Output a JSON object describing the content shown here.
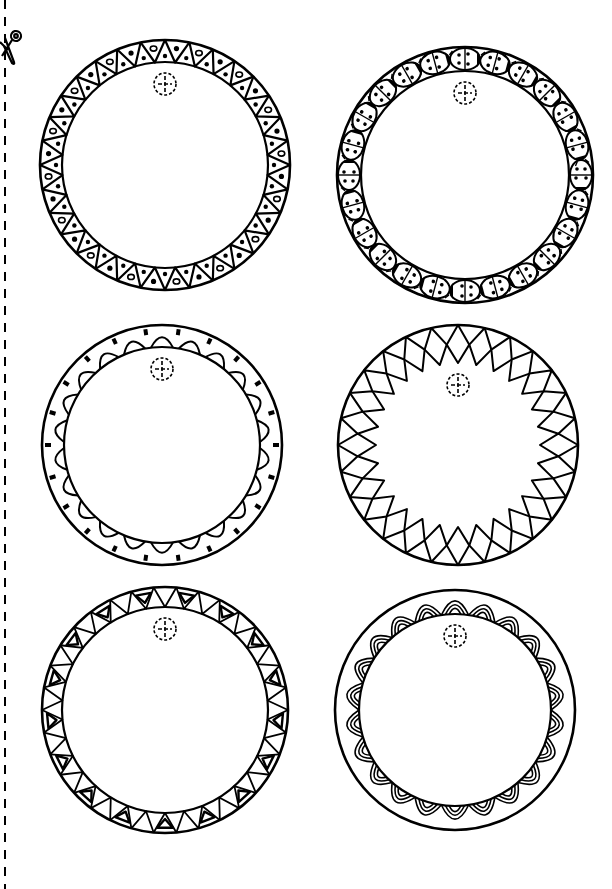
{
  "sheet": {
    "title": "Printable round gift tags",
    "ink_color": "#000000",
    "paper_color": "#ffffff",
    "cut_line": {
      "style": "dashed",
      "icon": "scissors-icon"
    }
  },
  "tags": [
    {
      "id": 1,
      "pattern": "triangles-with-dots",
      "border_label": "Triangle border with dots and rings",
      "segments": 32,
      "cx": 165,
      "cy": 165,
      "r": 125,
      "ring": 22
    },
    {
      "id": 2,
      "pattern": "ladybugs",
      "border_label": "Ladybug border",
      "segments": 24,
      "cx": 465,
      "cy": 175,
      "r": 128,
      "ring": 24
    },
    {
      "id": 3,
      "pattern": "scallops",
      "border_label": "Scalloped border",
      "segments": 22,
      "cx": 162,
      "cy": 445,
      "r": 120,
      "ring": 22
    },
    {
      "id": 4,
      "pattern": "zigzag-squares",
      "border_label": "Zigzag square border",
      "segments": 28,
      "cx": 458,
      "cy": 445,
      "r": 120,
      "ring": 38
    },
    {
      "id": 5,
      "pattern": "nested-triangles",
      "border_label": "Nested triangle border",
      "segments": 34,
      "cx": 165,
      "cy": 710,
      "r": 123,
      "ring": 20
    },
    {
      "id": 6,
      "pattern": "double-arches",
      "border_label": "Double arch border",
      "segments": 22,
      "cx": 455,
      "cy": 710,
      "r": 120,
      "ring": 24
    }
  ],
  "hole": {
    "style": "dashed-circle-crosshair",
    "r": 11
  }
}
